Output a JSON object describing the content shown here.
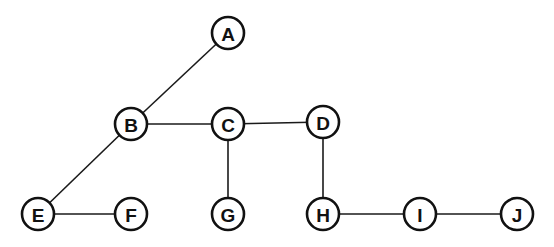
{
  "diagram": {
    "type": "tree-graph",
    "node_radius": 16,
    "colors": {
      "stroke": "#111111",
      "fill": "#ffffff",
      "background": "#ffffff"
    },
    "nodes": [
      {
        "id": "A",
        "label": "A",
        "x": 228,
        "y": 33
      },
      {
        "id": "B",
        "label": "B",
        "x": 131,
        "y": 124
      },
      {
        "id": "C",
        "label": "C",
        "x": 228,
        "y": 124
      },
      {
        "id": "D",
        "label": "D",
        "x": 323,
        "y": 122
      },
      {
        "id": "E",
        "label": "E",
        "x": 38,
        "y": 214
      },
      {
        "id": "F",
        "label": "F",
        "x": 131,
        "y": 214
      },
      {
        "id": "G",
        "label": "G",
        "x": 228,
        "y": 214
      },
      {
        "id": "H",
        "label": "H",
        "x": 323,
        "y": 214
      },
      {
        "id": "I",
        "label": "I",
        "x": 420,
        "y": 214
      },
      {
        "id": "J",
        "label": "J",
        "x": 517,
        "y": 214
      }
    ],
    "edges": [
      {
        "from": "A",
        "to": "B"
      },
      {
        "from": "B",
        "to": "C"
      },
      {
        "from": "C",
        "to": "D"
      },
      {
        "from": "B",
        "to": "E"
      },
      {
        "from": "E",
        "to": "F"
      },
      {
        "from": "C",
        "to": "G"
      },
      {
        "from": "D",
        "to": "H"
      },
      {
        "from": "H",
        "to": "I"
      },
      {
        "from": "I",
        "to": "J"
      }
    ]
  }
}
